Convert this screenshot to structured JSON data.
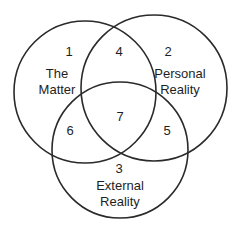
{
  "diagram": {
    "type": "venn-3",
    "stroke_color": "#2a2a2a",
    "circles": [
      {
        "id": 1,
        "name": "The Matter",
        "cx": 85,
        "cy": 92,
        "r": 71
      },
      {
        "id": 2,
        "name": "Personal Reality",
        "cx": 154,
        "cy": 88,
        "r": 73
      },
      {
        "id": 3,
        "name": "External Reality",
        "cx": 120,
        "cy": 150,
        "r": 68
      }
    ],
    "regions": [
      {
        "number": "1",
        "title_line1": "The",
        "title_line2": "Matter"
      },
      {
        "number": "2",
        "title_line1": "Personal",
        "title_line2": "Reality"
      },
      {
        "number": "3",
        "title_line1": "External",
        "title_line2": "Reality"
      },
      {
        "number": "4"
      },
      {
        "number": "5"
      },
      {
        "number": "6"
      },
      {
        "number": "7"
      }
    ]
  }
}
